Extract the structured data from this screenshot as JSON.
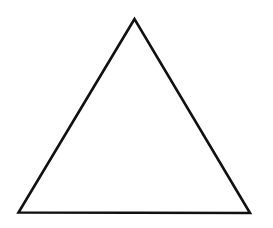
{
  "diagram": {
    "shape": "triangle",
    "kind": "equilateral",
    "fill": "none",
    "stroke_color": "#111111",
    "background_color": "#ffffff"
  }
}
